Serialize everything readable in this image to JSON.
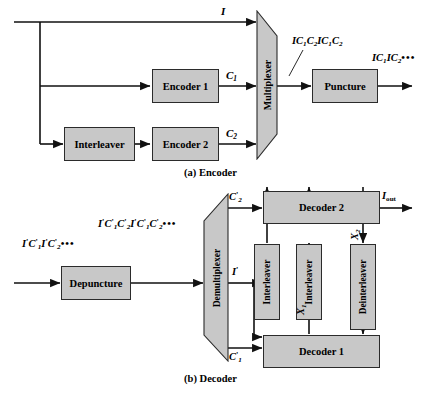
{
  "figure": {
    "captions": {
      "encoder": "(a) Encoder",
      "decoder": "(b) Decoder"
    },
    "colors": {
      "block_fill": "#c8c8c8",
      "stroke": "#2b2b2b",
      "background": "#ffffff"
    }
  },
  "encoder": {
    "blocks": {
      "encoder1": "Encoder 1",
      "encoder2": "Encoder 2",
      "interleaver": "Interleaver",
      "multiplexer": "Multiplexer",
      "puncture": "Puncture"
    },
    "signals": {
      "input": "I",
      "c1": "C",
      "c1_sub": "1",
      "c2": "C",
      "c2_sub": "2",
      "mux_out": "IC",
      "mux_out_full": "IC1C2IC1C2",
      "punct_out_full": "IC1IC2•••"
    }
  },
  "decoder": {
    "blocks": {
      "depuncture": "Depuncture",
      "demultiplexer": "Demultiplexer",
      "decoder1": "Decoder 1",
      "decoder2": "Decoder 2",
      "interleaver1": "Interleaver",
      "interleaver2": "Interleaver",
      "deinterleaver": "Deinterleaver"
    },
    "signals": {
      "input_stream": "I'C'1I'C'2•••",
      "depunct_out": "I'C'1C'2I'C'1C'2•••",
      "i_prime": "I'",
      "c2_prime": "C'2",
      "c1_prime": "C'1",
      "x1": "X1",
      "x2": "X2",
      "output": "Iout"
    }
  }
}
